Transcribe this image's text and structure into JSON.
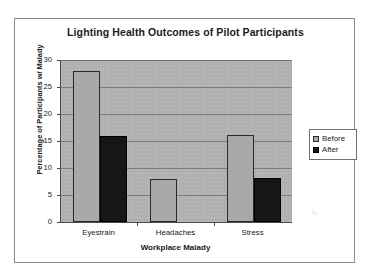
{
  "chart_data": {
    "type": "bar",
    "title": "Lighting Health Outcomes of Pilot Participants",
    "xlabel": "Workplace Malady",
    "ylabel": "Percentage of Participants w/ Malady",
    "categories": [
      "Eyestrain",
      "Headaches",
      "Stress"
    ],
    "series": [
      {
        "name": "Before",
        "values": [
          28,
          8,
          16.2
        ],
        "color": "#a9a9a9"
      },
      {
        "name": "After",
        "values": [
          16,
          0,
          8.2
        ],
        "color": "#161616"
      }
    ],
    "ylim": [
      0,
      30
    ],
    "yticks": [
      0,
      5,
      10,
      15,
      20,
      25,
      30
    ],
    "ytick_labels": [
      "0",
      "5",
      "10",
      "15",
      "20",
      "25",
      "30"
    ],
    "grid": true,
    "grid_axis": "y",
    "legend_position": "right",
    "plot_background": "#b4b4b4",
    "frame_color": "#8a8a8a"
  },
  "legend": {
    "entries": [
      {
        "label": "Before"
      },
      {
        "label": "After"
      }
    ]
  },
  "artifacts": {
    "mark_a": "∿",
    "mark_b": "·"
  }
}
